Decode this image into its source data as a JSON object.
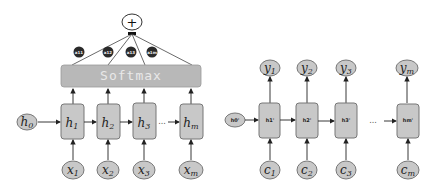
{
  "left_diagram": {
    "sum_symbol": "+",
    "softmax_label": "Softmax",
    "weights": [
      "a11",
      "a12",
      "a13",
      "a1m"
    ],
    "initial_state": {
      "base": "h",
      "sub": "0"
    },
    "hidden_states": [
      {
        "base": "h",
        "sub": "1"
      },
      {
        "base": "h",
        "sub": "2"
      },
      {
        "base": "h",
        "sub": "3"
      },
      {
        "base": "h",
        "sub": "m"
      }
    ],
    "inputs": [
      {
        "base": "x",
        "sub": "1"
      },
      {
        "base": "x",
        "sub": "2"
      },
      {
        "base": "x",
        "sub": "3"
      },
      {
        "base": "x",
        "sub": "m"
      }
    ],
    "ellipsis": "..."
  },
  "right_diagram": {
    "initial_state": "h0'",
    "hidden_states": [
      "h1'",
      "h2'",
      "h3'",
      "hm'"
    ],
    "outputs": [
      {
        "base": "y",
        "sub": "1"
      },
      {
        "base": "y",
        "sub": "2"
      },
      {
        "base": "y",
        "sub": "3"
      },
      {
        "base": "y",
        "sub": "m"
      }
    ],
    "inputs": [
      {
        "base": "c",
        "sub": "1"
      },
      {
        "base": "c",
        "sub": "2"
      },
      {
        "base": "c",
        "sub": "3"
      },
      {
        "base": "c",
        "sub": "m"
      }
    ],
    "ellipsis": "..."
  },
  "colors": {
    "node_fill": "#c8c8c8",
    "node_stroke": "#777777",
    "softmax_fill": "#b8b8b8",
    "weight_fill": "#2a2a2a",
    "line": "#333333"
  }
}
